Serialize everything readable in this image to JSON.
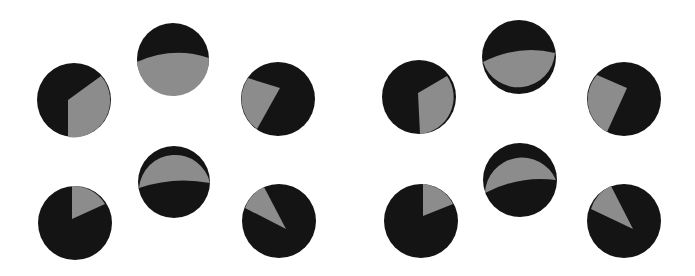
{
  "colors": {
    "background": "#ffffff",
    "dark": "#141414",
    "light": "#8c8c8c"
  },
  "panels": [
    {
      "name": "left-panel",
      "discs": [
        {
          "id": "disc-top-left",
          "cx": 74,
          "cy": 100,
          "r": 37,
          "gray_path": "M68,100 L101,76 A37,37 0 0 1 68,137 Z"
        },
        {
          "id": "disc-top-center",
          "cx": 173,
          "cy": 59,
          "r": 36,
          "gray_path": "M137,62 Q173,46 209,58 A36,36 0 0 1 137,62 Z"
        },
        {
          "id": "disc-top-right",
          "cx": 278,
          "cy": 99,
          "r": 37,
          "gray_path": "M280,88 L248,78 A37,37 0 0 0 257,129 Z"
        },
        {
          "id": "disc-bottom-left",
          "cx": 75,
          "cy": 223,
          "r": 37,
          "gray_path": "M72,219 L72,186 A37,37 0 0 1 105,204 Z"
        },
        {
          "id": "disc-bottom-center",
          "cx": 174,
          "cy": 182,
          "r": 36,
          "gray_path": "M139,188 Q174,176 210,183 A36,36 0 0 0 139,188 Z"
        },
        {
          "id": "disc-bottom-right",
          "cx": 279,
          "cy": 221,
          "r": 37,
          "gray_path": "M286,229 L245,208 A37,37 0 0 1 264,187 Z"
        }
      ]
    },
    {
      "name": "right-panel",
      "discs": [
        {
          "id": "disc-top-left",
          "cx": 419,
          "cy": 97,
          "r": 37,
          "gray_path": "M418,93 L447,76 A37,37 0 0 1 420,134 Z"
        },
        {
          "id": "disc-top-center",
          "cx": 519,
          "cy": 57,
          "r": 37,
          "gray_path": "M483,62 Q519,44 555,53 A37,37 0 0 1 483,62 Z"
        },
        {
          "id": "disc-top-right",
          "cx": 624,
          "cy": 99,
          "r": 37,
          "gray_path": "M627,88 L597,75 A37,37 0 0 0 607,132 Z"
        },
        {
          "id": "disc-bottom-left",
          "cx": 421,
          "cy": 221,
          "r": 37,
          "gray_path": "M423,216 L423,184 A37,37 0 0 1 453,204 Z"
        },
        {
          "id": "disc-bottom-center",
          "cx": 520,
          "cy": 180,
          "r": 37,
          "gray_path": "M485,193 Q520,175 556,180 A37,37 0 0 0 485,193 Z"
        },
        {
          "id": "disc-bottom-right",
          "cx": 624,
          "cy": 221,
          "r": 37,
          "gray_path": "M633,229 L591,209 A37,37 0 0 1 611,186 Z"
        }
      ]
    }
  ]
}
